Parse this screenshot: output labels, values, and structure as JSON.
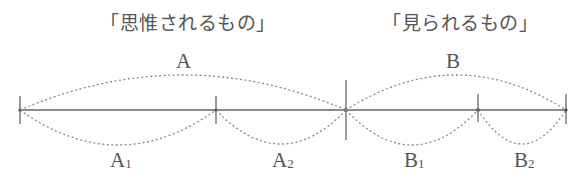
{
  "titles": {
    "left": "「思惟されるもの」",
    "right": "「見られるもの」"
  },
  "labels": {
    "A": {
      "main": "A",
      "sub": ""
    },
    "B": {
      "main": "B",
      "sub": ""
    },
    "A1": {
      "main": "A",
      "sub": "1"
    },
    "A2": {
      "main": "A",
      "sub": "2"
    },
    "B1": {
      "main": "B",
      "sub": "1"
    },
    "B2": {
      "main": "B",
      "sub": "2"
    }
  },
  "colors": {
    "line": "#666666",
    "dotted": "#888888",
    "text": "#555555"
  }
}
